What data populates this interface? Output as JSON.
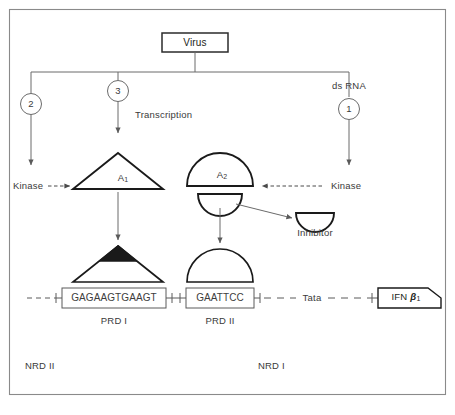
{
  "figure": {
    "frame_color": "#8a8a8a",
    "ink_color": "#231f20",
    "text_color": "#3a3a3a"
  },
  "nodes": {
    "virus": {
      "label": "Virus"
    },
    "ds_rna": {
      "label": "ds RNA"
    },
    "circle_2": {
      "label": "2"
    },
    "circle_3": {
      "label": "3"
    },
    "circle_1": {
      "label": "1"
    },
    "transcription": {
      "label": "Transcription"
    },
    "kinase_left": {
      "label": "Kinase"
    },
    "kinase_right": {
      "label": "Kinase"
    },
    "factor_a1": {
      "label": "A",
      "sub": "1"
    },
    "factor_a2": {
      "label": "A",
      "sub": "2"
    },
    "inhibitor": {
      "label": "Inhibitor"
    },
    "prd1_box": {
      "sequence": "GAGAAGTGAAGT",
      "label": "PRD I"
    },
    "prd2_box": {
      "sequence": "GAATTCC",
      "label": "PRD II"
    },
    "tata": {
      "label": "Tata"
    },
    "ifn_gene": {
      "label": "IFN ",
      "gene": "β",
      "sub": "1"
    },
    "nrd2": {
      "label": "NRD II"
    },
    "nrd1": {
      "label": "NRD I"
    }
  },
  "caption": {
    "text": ""
  }
}
